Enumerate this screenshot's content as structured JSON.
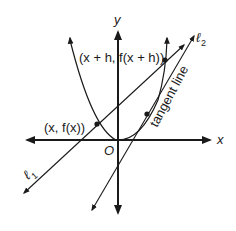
{
  "diagram": {
    "type": "tangent-line-secant-diagram",
    "axes": {
      "x_label": "x",
      "y_label": "y",
      "origin_label": "O"
    },
    "curve": {
      "kind": "parabola",
      "description": "upward-opening parabola with vertex near origin"
    },
    "points": {
      "p1_label": "(x, f(x))",
      "p2_label": "(x + h, f(x + h))"
    },
    "lines": {
      "secant_label": "ℓ",
      "secant_subscript": "1",
      "tangent_label": "ℓ",
      "tangent_subscript": "2",
      "tangent_annotation": "tangent line"
    },
    "colors": {
      "ink": "#1a1a1a",
      "background": "#ffffff"
    }
  }
}
